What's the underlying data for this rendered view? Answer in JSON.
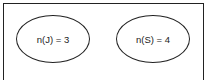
{
  "diagram": {
    "type": "venn",
    "universe": "rectangle",
    "sets": [
      {
        "id": "J",
        "label": "n(J) = 3"
      },
      {
        "id": "S",
        "label": "n(S) = 4"
      }
    ],
    "overlap": false
  }
}
